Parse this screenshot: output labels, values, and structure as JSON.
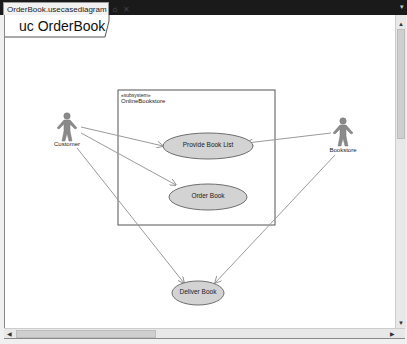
{
  "tab": {
    "title": "OrderBook.usecasediagram",
    "pin_icon": "pin-icon",
    "close_icon": "close-icon",
    "pin_glyph": "⌂",
    "close_glyph": "✕"
  },
  "diagram": {
    "frame_label": "uc OrderBook",
    "subsystem": {
      "stereotype": "«subsystem»",
      "name": "OnlineBookstore"
    },
    "actors": [
      {
        "id": "customer",
        "label": "Customer"
      },
      {
        "id": "bookstore",
        "label": "Bookstore"
      }
    ],
    "use_cases": [
      {
        "id": "provide-book-list",
        "label": "Provide Book List"
      },
      {
        "id": "order-book",
        "label": "Order Book"
      },
      {
        "id": "deliver-book",
        "label": "Deliver Book"
      }
    ],
    "colors": {
      "use_case_fill": "#d3d3d3",
      "use_case_stroke": "#6e6e6e",
      "actor_fill": "#8a8a8a",
      "line": "#9a9a9a",
      "box": "#555555"
    }
  },
  "scrollbars": {
    "up_glyph": "▲",
    "down_glyph": "▼",
    "left_glyph": "◀",
    "right_glyph": "▶"
  }
}
